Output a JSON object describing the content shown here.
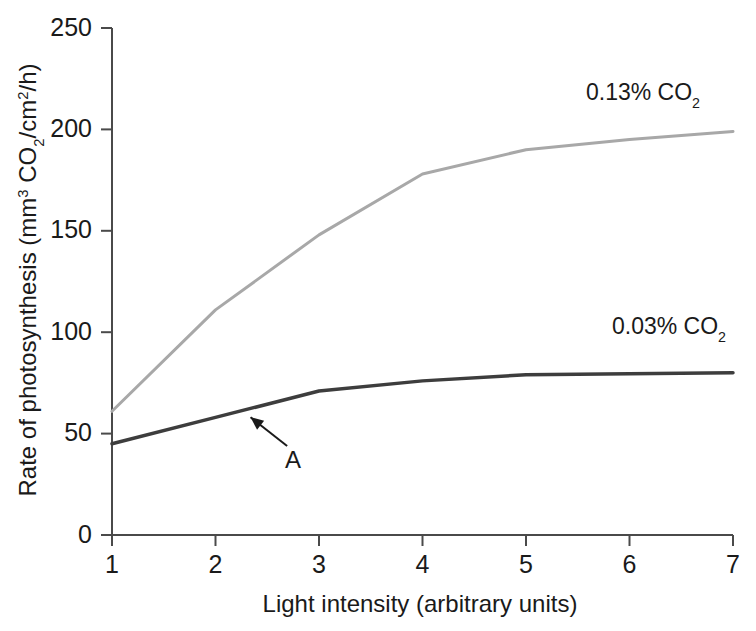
{
  "chart_data": {
    "type": "line",
    "title": "",
    "xlabel": "Light intensity (arbitrary units)",
    "ylabel_parts": {
      "prefix": "Rate of photosynthesis (mm",
      "sup1": "3",
      "mid1": " CO",
      "sub1": "2",
      "mid2": "/cm",
      "sup2": "2",
      "suffix": "/h)"
    },
    "ylabel": "Rate of photosynthesis (mm3 CO2/cm2/h)",
    "x": [
      1,
      2,
      3,
      4,
      5,
      6,
      7
    ],
    "xlim": [
      1,
      7
    ],
    "ylim": [
      0,
      250
    ],
    "xticks": [
      "1",
      "2",
      "3",
      "4",
      "5",
      "6",
      "7"
    ],
    "yticks": [
      "0",
      "50",
      "100",
      "150",
      "200",
      "250"
    ],
    "ytick_values": [
      0,
      50,
      100,
      150,
      200,
      250
    ],
    "grid": false,
    "legend_position": "inline-right",
    "series": [
      {
        "name": "0.13% CO2",
        "label_prefix": "0.13% CO",
        "label_sub": "2",
        "color": "#a8a8a8",
        "width": 3,
        "values": [
          61,
          111,
          148,
          178,
          190,
          195,
          199
        ]
      },
      {
        "name": "0.03% CO2",
        "label_prefix": "0.03% CO",
        "label_sub": "2",
        "color": "#3d3d3d",
        "width": 3.5,
        "values": [
          45,
          58,
          71,
          76,
          79,
          79.5,
          80
        ]
      }
    ],
    "annotations": [
      {
        "text": "A",
        "target_x": 2.3,
        "target_y": 63,
        "label_x": 2.75,
        "label_y": 33
      }
    ]
  }
}
